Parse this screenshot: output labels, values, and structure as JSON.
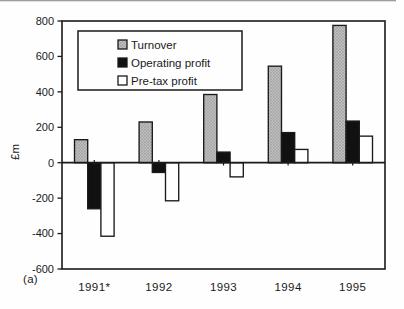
{
  "figure": {
    "panel_label": "(a)"
  },
  "chart_data": {
    "type": "bar",
    "title": "",
    "xlabel": "",
    "ylabel": "£m",
    "categories": [
      "1991*",
      "1992",
      "1993",
      "1994",
      "1995"
    ],
    "series": [
      {
        "name": "Turnover",
        "values": [
          130,
          230,
          385,
          545,
          775
        ],
        "color": "#b5b5b5",
        "fill_style": "halftone"
      },
      {
        "name": "Operating profit",
        "values": [
          -260,
          -55,
          60,
          170,
          235
        ],
        "color": "#111111",
        "fill_style": "solid"
      },
      {
        "name": "Pre-tax profit",
        "values": [
          -415,
          -215,
          -80,
          75,
          150
        ],
        "color": "#ffffff",
        "fill_style": "solid"
      }
    ],
    "ylim": [
      -600,
      800
    ],
    "ytick_step": 200,
    "yticks": [
      800,
      600,
      400,
      200,
      0,
      -200,
      -400,
      -600
    ],
    "grid": false,
    "legend_position": "top-left",
    "axis_color": "#1a1a1a",
    "bar_border_color": "#1a1a1a"
  }
}
